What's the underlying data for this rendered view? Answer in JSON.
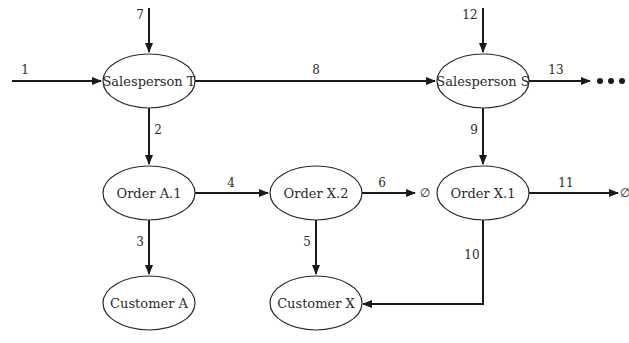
{
  "nodes": [
    {
      "id": "sp_t",
      "label": "Salesperson T",
      "cx": 149,
      "cy": 81
    },
    {
      "id": "sp_s",
      "label": "Salesperson S",
      "cx": 483,
      "cy": 81
    },
    {
      "id": "ord_a1",
      "label": "Order A.1",
      "cx": 149,
      "cy": 193
    },
    {
      "id": "ord_x2",
      "label": "Order X.2",
      "cx": 316,
      "cy": 193
    },
    {
      "id": "ord_x1",
      "label": "Order X.1",
      "cx": 483,
      "cy": 193
    },
    {
      "id": "cust_a",
      "label": "Customer A",
      "cx": 149,
      "cy": 303
    },
    {
      "id": "cust_x",
      "label": "Customer X",
      "cx": 316,
      "cy": 303
    }
  ],
  "node_size": {
    "rx": 46,
    "ry": 27
  },
  "edges": [
    {
      "label": "1",
      "from": "external",
      "to": "Salesperson T",
      "points": [
        [
          12,
          81
        ],
        [
          101,
          81
        ]
      ],
      "label_pos": [
        25,
        70
      ]
    },
    {
      "label": "7",
      "from": "external",
      "to": "Salesperson T",
      "points": [
        [
          149,
          8
        ],
        [
          149,
          52
        ]
      ],
      "label_pos": [
        140,
        15
      ]
    },
    {
      "label": "8",
      "from": "Salesperson T",
      "to": "Salesperson S",
      "points": [
        [
          195,
          81
        ],
        [
          435,
          81
        ]
      ],
      "label_pos": [
        316,
        70
      ]
    },
    {
      "label": "12",
      "from": "external",
      "to": "Salesperson S",
      "points": [
        [
          483,
          8
        ],
        [
          483,
          52
        ]
      ],
      "label_pos": [
        470,
        15
      ]
    },
    {
      "label": "13",
      "from": "Salesperson S",
      "to": "continuation",
      "points": [
        [
          529,
          81
        ],
        [
          590,
          81
        ]
      ],
      "label_pos": [
        556,
        70
      ]
    },
    {
      "label": "2",
      "from": "Salesperson T",
      "to": "Order A.1",
      "points": [
        [
          149,
          108
        ],
        [
          149,
          164
        ]
      ],
      "label_pos": [
        158,
        130
      ]
    },
    {
      "label": "9",
      "from": "Salesperson S",
      "to": "Order X.1",
      "points": [
        [
          483,
          108
        ],
        [
          483,
          164
        ]
      ],
      "label_pos": [
        474,
        130
      ]
    },
    {
      "label": "4",
      "from": "Order A.1",
      "to": "Order X.2",
      "points": [
        [
          195,
          193
        ],
        [
          268,
          193
        ]
      ],
      "label_pos": [
        231,
        183
      ]
    },
    {
      "label": "6",
      "from": "Order X.2",
      "to": "∅",
      "points": [
        [
          362,
          193
        ],
        [
          415,
          193
        ]
      ],
      "label_pos": [
        382,
        183
      ]
    },
    {
      "label": "11",
      "from": "Order X.1",
      "to": "∅",
      "points": [
        [
          529,
          193
        ],
        [
          618,
          193
        ]
      ],
      "label_pos": [
        566,
        183
      ]
    },
    {
      "label": "3",
      "from": "Order A.1",
      "to": "Customer A",
      "points": [
        [
          149,
          220
        ],
        [
          149,
          274
        ]
      ],
      "label_pos": [
        140,
        242
      ]
    },
    {
      "label": "5",
      "from": "Order X.2",
      "to": "Customer X",
      "points": [
        [
          316,
          220
        ],
        [
          316,
          274
        ]
      ],
      "label_pos": [
        307,
        242
      ]
    },
    {
      "label": "10",
      "from": "Order X.1",
      "to": "Customer X",
      "points": [
        [
          483,
          220
        ],
        [
          483,
          304
        ],
        [
          363,
          304
        ]
      ],
      "label_pos": [
        472,
        255
      ]
    }
  ],
  "sinks": [
    {
      "symbol": "∅",
      "x": 425,
      "y": 193
    },
    {
      "symbol": "∅",
      "x": 625,
      "y": 193
    }
  ],
  "continuation": {
    "symbol": "•••",
    "dots": [
      [
        600,
        81
      ],
      [
        611,
        81
      ],
      [
        622,
        81
      ]
    ]
  },
  "colors": {
    "stroke": "#1a1a1a",
    "text": "#2a2a2a",
    "background": "#ffffff"
  }
}
